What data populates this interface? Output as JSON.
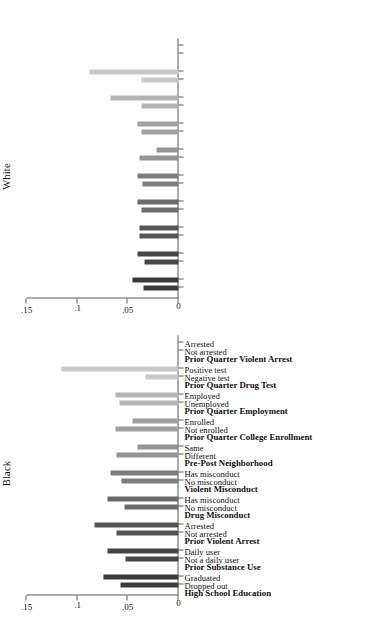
{
  "figure": {
    "panels": [
      {
        "key": "black",
        "title": "Black"
      },
      {
        "key": "white",
        "title": "White"
      }
    ],
    "axis": {
      "ticks": [
        "0",
        ".05",
        ".1",
        ".15"
      ],
      "tick_values": [
        0,
        0.05,
        0.1,
        0.15
      ],
      "min": 0,
      "max": 0.15
    }
  },
  "chart_data": {
    "type": "bar",
    "title": "",
    "subtitle": "",
    "xlabel": "",
    "ylabel": "",
    "ylim": [
      0,
      0.15
    ],
    "grid": false,
    "legend": false,
    "orientation": "vertical-bars-in-rotated-figure",
    "panel_titles": [
      "White",
      "Black"
    ],
    "axis_ticks": [
      0,
      0.05,
      0.1,
      0.15
    ],
    "axis_tick_labels": [
      "0",
      ".05",
      ".1",
      ".15"
    ],
    "groups": [
      {
        "header": "High School Education",
        "color": "#3b3b3b",
        "categories": [
          "Dropped out",
          "Graduated"
        ],
        "white": [
          0.0345,
          0.0455
        ],
        "black": [
          0.0575,
          0.0745
        ]
      },
      {
        "header": "Prior Substance Use",
        "color": "#464646",
        "categories": [
          "Not a daily user",
          "Daily user"
        ],
        "white": [
          0.034,
          0.0405
        ],
        "black": [
          0.0525,
          0.07
        ]
      },
      {
        "header": "Prior Violent Arrest",
        "color": "#555555",
        "categories": [
          "Not arrested",
          "Arrested"
        ],
        "white": [
          0.0385,
          0.0385
        ],
        "black": [
          0.061,
          0.0825
        ]
      },
      {
        "header": "Drug Misconduct",
        "color": "#6b6b6b",
        "categories": [
          "No misconduct",
          "Has misconduct"
        ],
        "white": [
          0.037,
          0.0405
        ],
        "black": [
          0.053,
          0.0705
        ]
      },
      {
        "header": "Violent Misconduct",
        "color": "#7d7d7d",
        "categories": [
          "No misconduct",
          "Has misconduct"
        ],
        "white": [
          0.036,
          0.0405
        ],
        "black": [
          0.0565,
          0.067
        ]
      },
      {
        "header": "Pre-Post Neighborhood",
        "color": "#949494",
        "categories": [
          "Different",
          "Same"
        ],
        "white": [
          0.0385,
          0.0215
        ],
        "black": [
          0.061,
          0.04
        ]
      },
      {
        "header": "Prior Quarter College Enrollment",
        "color": "#a0a0a0",
        "categories": [
          "Not enrolled",
          "Enrolled"
        ],
        "white": [
          0.037,
          0.0405
        ],
        "black": [
          0.0625,
          0.0455
        ]
      },
      {
        "header": "Prior Quarter Employment",
        "color": "#b5b5b5",
        "categories": [
          "Unemployed",
          "Employed"
        ],
        "white": [
          0.037,
          0.0675
        ],
        "black": [
          0.0585,
          0.0625
        ]
      },
      {
        "header": "Prior Quarter Drug Test",
        "color": "#c9c9c9",
        "categories": [
          "Negative test",
          "Positive test"
        ],
        "white": [
          0.0365,
          0.088
        ],
        "black": [
          0.033,
          0.115
        ]
      },
      {
        "header": "Prior Quarter Violent Arrest",
        "color": "#dcdcdc",
        "categories": [
          "Not arrested",
          "Arrested"
        ],
        "white": [],
        "black": []
      }
    ]
  }
}
